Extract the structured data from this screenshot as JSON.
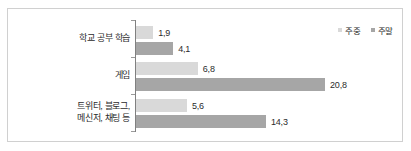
{
  "chart_data": {
    "type": "bar",
    "orientation": "horizontal",
    "title": "",
    "subtitle": "",
    "xlabel": "",
    "ylabel": "",
    "grid": false,
    "legend_position": "top-right",
    "xlim": [
      0,
      22.5
    ],
    "categories": [
      "학교 공부 학습",
      "게임",
      "트위터, 블로그,\n메신저, 채팅 등"
    ],
    "category_lines": [
      [
        "학교 공부 학습"
      ],
      [
        "게임"
      ],
      [
        "트위터, 블로그,",
        "메신저, 채팅 등"
      ]
    ],
    "series": [
      {
        "name": "주중",
        "color": "#d9d9d9",
        "values": [
          1.9,
          6.8,
          5.6
        ],
        "value_labels": [
          "1,9",
          "6,8",
          "5,6"
        ]
      },
      {
        "name": "주말",
        "color": "#a6a6a6",
        "values": [
          4.1,
          20.8,
          14.3
        ],
        "value_labels": [
          "4,1",
          "20,8",
          "14,3"
        ]
      }
    ]
  },
  "legend": {
    "items": [
      {
        "label": "주중",
        "color": "#d9d9d9"
      },
      {
        "label": "주말",
        "color": "#a6a6a6"
      }
    ]
  },
  "axis": {
    "line_color": "#808080",
    "tick_color": "#9a9a9a"
  },
  "frame": {
    "border_color": "#d0d0d0",
    "background": "#ffffff"
  }
}
